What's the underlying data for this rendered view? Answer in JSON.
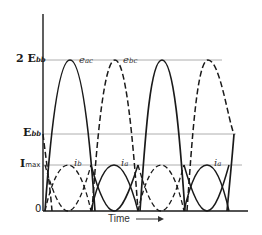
{
  "diagram": {
    "y_axis_labels": {
      "two_ebb": {
        "main": "2 E",
        "sub": "bb"
      },
      "ebb": {
        "main": "E",
        "sub": "bb"
      },
      "imax": {
        "main": "I",
        "sub": "max"
      },
      "zero": "0"
    },
    "x_axis_label": "Time",
    "x_axis_arrow": "→",
    "curve_labels": {
      "e_ac": {
        "main": "e",
        "sub": "ac"
      },
      "e_bc": {
        "main": "e",
        "sub": "bc"
      },
      "i_b": {
        "main": "i",
        "sub": "b"
      },
      "i_a_1": {
        "main": "i",
        "sub": "a"
      },
      "i_a_2": {
        "main": "i",
        "sub": "a"
      }
    },
    "colors": {
      "line": "#1a1a1a",
      "guide": "#9a9a9a"
    }
  }
}
